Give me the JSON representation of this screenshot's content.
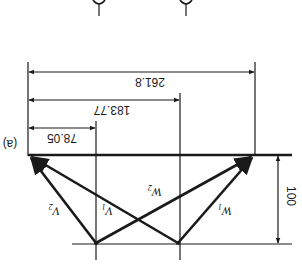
{
  "figure": {
    "panel_label": "(a)",
    "orientation": "rotated 180 degrees",
    "dimensions": {
      "total": "261.8",
      "middle": "183.77",
      "short": "78.05",
      "height": "100"
    },
    "vectors": [
      {
        "name": "V",
        "sub": "1"
      },
      {
        "name": "V",
        "sub": "2"
      },
      {
        "name": "W",
        "sub": "1"
      },
      {
        "name": "W",
        "sub": "2"
      }
    ],
    "top_glyphs": [
      "blade-profile-1",
      "blade-profile-2"
    ],
    "colors": {
      "line": "#1a1a1a",
      "background": "#ffffff"
    }
  }
}
